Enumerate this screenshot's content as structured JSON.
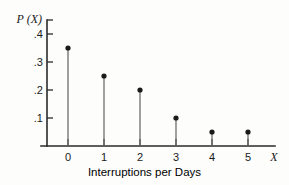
{
  "chart_data": {
    "type": "scatter",
    "title": "",
    "subtitle": "",
    "xlabel": "Interruptions per Days",
    "ylabel": "P (X)",
    "x_axis_symbol": "X",
    "y_axis_symbol": "P (X)",
    "categories": [
      "0",
      "1",
      "2",
      "3",
      "4",
      "5"
    ],
    "x": [
      0,
      1,
      2,
      3,
      4,
      5
    ],
    "values": [
      0.35,
      0.25,
      0.2,
      0.1,
      0.05,
      0.05
    ],
    "xtick_labels": [
      "0",
      "1",
      "2",
      "3",
      "4",
      "5"
    ],
    "ytick_labels": [
      ".4",
      ".3",
      ".2",
      ".1"
    ],
    "ytick_values": [
      0.4,
      0.3,
      0.2,
      0.1
    ],
    "xlim": [
      -0.5,
      6.0
    ],
    "ylim": [
      0,
      0.45
    ],
    "grid": false,
    "legend": null,
    "marker": "filled-circle",
    "stems": true,
    "colors": {
      "axis": "#2a2a2a",
      "stem": "#6e6e6e",
      "marker": "#1a1a1a",
      "background": "#fdfdfc",
      "text": "#1a1a1a"
    }
  }
}
